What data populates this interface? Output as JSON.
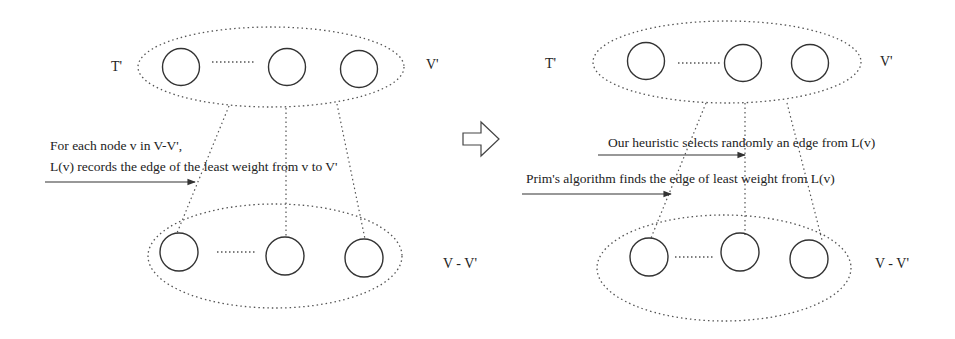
{
  "left_panel": {
    "top_set_label_left": "T'",
    "top_set_label_right": "V'",
    "bottom_set_label": "V - V'",
    "caption_line1": "For each node v in V-V',",
    "caption_line2": "L(v) records the edge of the least weight from v to  V'"
  },
  "transition_arrow": "right-hollow-arrow-icon",
  "right_panel": {
    "top_set_label_left": "T'",
    "top_set_label_right": "V'",
    "bottom_set_label": "V - V'",
    "heuristic_caption": "Our heuristic selects randomly an edge from L(v)",
    "prim_caption": "Prim's algorithm finds the edge of least weight from L(v)"
  },
  "colors": {
    "stroke": "#333333",
    "dotted": "#555555",
    "background": "#ffffff"
  }
}
